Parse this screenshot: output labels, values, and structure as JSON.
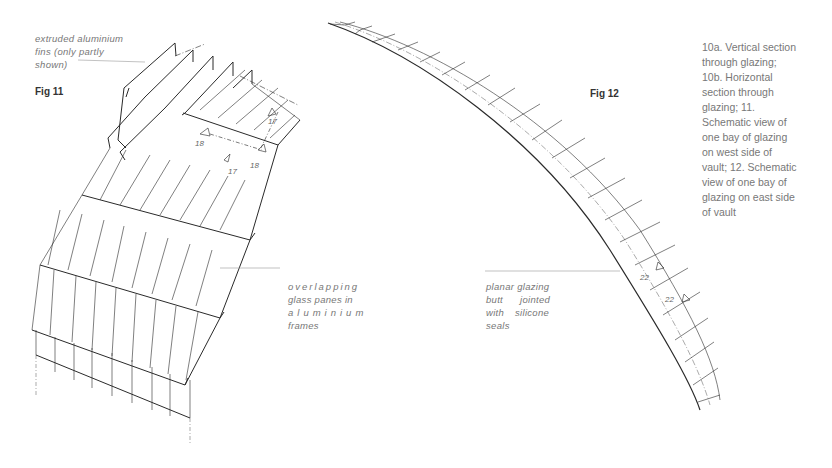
{
  "figures": {
    "fig11": {
      "title": "Fig 11",
      "annotations": {
        "fins": [
          "extruded aluminium",
          "fins (only partly",
          "shown)"
        ],
        "panes": [
          "overlapping",
          "glass panes in",
          "aluminium",
          "frames"
        ]
      },
      "dimension_labels": [
        "17",
        "18",
        "18",
        "17"
      ]
    },
    "fig12": {
      "title": "Fig 12",
      "annotations": {
        "glazing": [
          "planar glazing",
          "butt jointed",
          "with silicone",
          "seals"
        ]
      },
      "dimension_labels": [
        "22",
        "22"
      ]
    }
  },
  "caption": "10a. Vertical section through glazing; 10b. Horizontal section through glazing; 11. Schematic view of one bay of glazing on west side of vault; 12. Schematic view of one bay of glazing on east side of vault",
  "colors": {
    "ink": "#2a2a2a",
    "text": "#777777"
  }
}
